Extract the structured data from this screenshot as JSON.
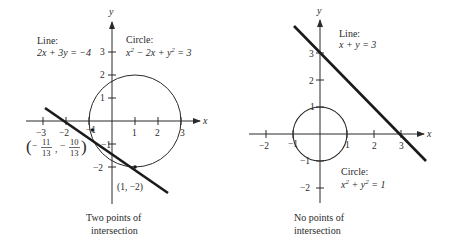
{
  "left_panel": {
    "line_label": "Line:",
    "line_equation": "2x + 3y = −4",
    "circle_label": "Circle:",
    "circle_equation_parts": [
      "x",
      "2",
      " − 2x + ",
      "y",
      "2",
      " = 3"
    ],
    "axis_x_label": "x",
    "axis_y_label": "y",
    "x_ticks": [
      "−3",
      "−2",
      "−1",
      "1",
      "2",
      "3"
    ],
    "y_ticks": [
      "3",
      "2",
      "1",
      "−1",
      "−2"
    ],
    "point_a": {
      "open": "(",
      "minus": "−",
      "num_x": "11",
      "den_x": "13",
      "comma": ",",
      "num_y": "10",
      "den_y": "13",
      "close": ")"
    },
    "point_b": "(1, −2)",
    "caption_line1": "Two points of",
    "caption_line2": "intersection"
  },
  "right_panel": {
    "line_label": "Line:",
    "line_equation": "x + y = 3",
    "circle_label": "Circle:",
    "circle_equation_parts": [
      "x",
      "2",
      " + ",
      "y",
      "2",
      " = 1"
    ],
    "axis_x_label": "x",
    "axis_y_label": "y",
    "x_ticks": [
      "−2",
      "−1",
      "1",
      "2",
      "3"
    ],
    "y_ticks": [
      "3",
      "2",
      "1",
      "−1",
      "−2"
    ],
    "caption_line1": "No points of",
    "caption_line2": "intersection"
  },
  "colors": {
    "ink": "#2a2a2a",
    "line": "#1a1a1a"
  }
}
